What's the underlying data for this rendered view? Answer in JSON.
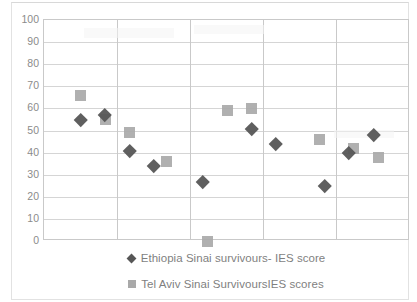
{
  "chart_data": {
    "type": "scatter",
    "title_visible_fragment": "",
    "xlabel": "",
    "ylabel": "",
    "ylim": [
      0,
      100
    ],
    "ytick_step": 10,
    "yticks": [
      "100",
      "90",
      "80",
      "70",
      "60",
      "50",
      "40",
      "30",
      "20",
      "10",
      "0"
    ],
    "grid": "horizontal-and-vertical",
    "xaxis_ticklabels": [],
    "legend_position": "bottom",
    "vertical_gridline_count": 4,
    "series": [
      {
        "name": "Ethiopia Sinai survivours- IES score",
        "marker": "diamond",
        "color": "#565656",
        "points": [
          {
            "x": 2.0,
            "y": 55
          },
          {
            "x": 3.0,
            "y": 57
          },
          {
            "x": 4.0,
            "y": 41
          },
          {
            "x": 5.0,
            "y": 34
          },
          {
            "x": 7.0,
            "y": 27
          },
          {
            "x": 9.0,
            "y": 51
          },
          {
            "x": 10.0,
            "y": 44
          },
          {
            "x": 12.0,
            "y": 25
          },
          {
            "x": 13.0,
            "y": 40
          },
          {
            "x": 14.0,
            "y": 48
          }
        ]
      },
      {
        "name": "Tel Aviv Sinai SurvivoursIES scores",
        "marker": "square",
        "color": "#a9a9a9",
        "points": [
          {
            "x": 2.0,
            "y": 66
          },
          {
            "x": 3.0,
            "y": 55
          },
          {
            "x": 4.0,
            "y": 49
          },
          {
            "x": 5.5,
            "y": 36
          },
          {
            "x": 7.2,
            "y": 0
          },
          {
            "x": 8.0,
            "y": 59
          },
          {
            "x": 9.0,
            "y": 60
          },
          {
            "x": 11.8,
            "y": 46
          },
          {
            "x": 13.2,
            "y": 42
          },
          {
            "x": 14.2,
            "y": 38
          }
        ]
      }
    ]
  },
  "legend": {
    "entries": [
      {
        "label": "Ethiopia Sinai survivours- IES score",
        "marker": "diamond-marker-icon"
      },
      {
        "label": "Tel Aviv Sinai SurvivoursIES scores",
        "marker": "square-marker-icon"
      }
    ]
  }
}
